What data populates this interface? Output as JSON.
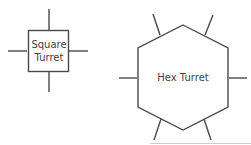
{
  "diagram": {
    "square_turret": {
      "label_line1": "Square",
      "label_line2": "Turret"
    },
    "hex_turret": {
      "label": "Hex Turret"
    },
    "colors": {
      "stroke": "#4a4a4a",
      "text": "#444444",
      "baseline": "#cccccc"
    }
  }
}
